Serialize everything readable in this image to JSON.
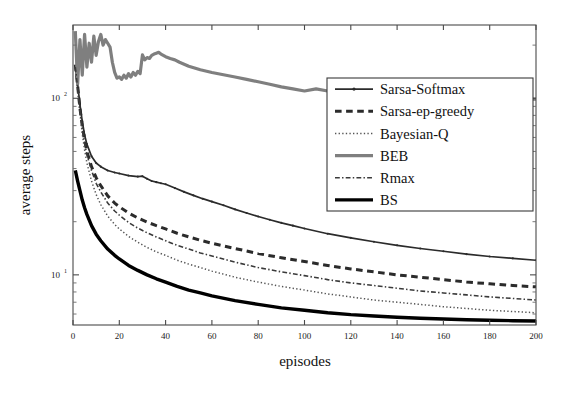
{
  "chart_data": {
    "type": "line",
    "title": "",
    "xlabel": "episodes",
    "ylabel": "average steps",
    "yscale": "log",
    "xscale": "linear",
    "xlim": [
      0,
      200
    ],
    "ylim": [
      5.2,
      260
    ],
    "xticks": [
      0,
      20,
      40,
      60,
      80,
      100,
      120,
      140,
      160,
      180,
      200
    ],
    "xticklabels": [
      "0",
      "20",
      "40",
      "60",
      "80",
      "100",
      "120",
      "140",
      "160",
      "180",
      "200"
    ],
    "yticks": [
      10,
      100
    ],
    "yticklabels": [
      "10",
      "10"
    ],
    "ytick_exponents": [
      "1",
      "2"
    ],
    "grid": false,
    "legend_position": "upper-right-inset",
    "series": [
      {
        "name": "Sarsa-Softmax",
        "color": "#2b2b2b",
        "style": "solid",
        "width": 1.7,
        "marker": "dot",
        "x": [
          1,
          2,
          3,
          4,
          5,
          6,
          8,
          10,
          12,
          15,
          18,
          20,
          24,
          28,
          30,
          32,
          34,
          36,
          38,
          40,
          44,
          48,
          52,
          56,
          60,
          65,
          70,
          75,
          80,
          85,
          90,
          95,
          100,
          110,
          120,
          130,
          140,
          150,
          160,
          170,
          180,
          190,
          200
        ],
        "y": [
          150,
          120,
          92,
          74,
          62,
          55,
          47,
          43,
          41,
          39,
          38,
          37.5,
          36.5,
          36,
          36.2,
          35,
          34,
          33.5,
          33,
          32.6,
          31,
          29.5,
          28.2,
          27,
          26,
          24.8,
          23.5,
          22.4,
          21.4,
          20.5,
          19.7,
          19,
          18.3,
          17.1,
          16.2,
          15.4,
          14.7,
          14.1,
          13.6,
          13.1,
          12.7,
          12.4,
          12.1
        ]
      },
      {
        "name": "Sarsa-ep-greedy",
        "color": "#2b2b2b",
        "style": "dashed",
        "width": 3.0,
        "x": [
          1,
          2,
          3,
          4,
          5,
          6,
          8,
          10,
          12,
          15,
          18,
          20,
          24,
          28,
          32,
          36,
          40,
          45,
          50,
          55,
          60,
          70,
          80,
          90,
          100,
          110,
          120,
          130,
          140,
          150,
          160,
          170,
          180,
          190,
          200
        ],
        "y": [
          155,
          118,
          88,
          70,
          58,
          50,
          41,
          35.5,
          32,
          28,
          25.5,
          24.3,
          22.4,
          21,
          19.9,
          19,
          18.2,
          17.2,
          16.4,
          15.7,
          15.1,
          14.1,
          13.2,
          12.5,
          11.9,
          11.3,
          10.8,
          10.4,
          10.0,
          9.7,
          9.4,
          9.1,
          8.9,
          8.7,
          8.55
        ]
      },
      {
        "name": "Bayesian-Q",
        "color": "#555555",
        "style": "dotted",
        "width": 1.5,
        "x": [
          1,
          2,
          3,
          4,
          5,
          6,
          8,
          10,
          12,
          15,
          18,
          20,
          24,
          28,
          32,
          36,
          40,
          45,
          50,
          55,
          60,
          70,
          80,
          90,
          100,
          110,
          120,
          130,
          140,
          150,
          160,
          170,
          180,
          190,
          200
        ],
        "y": [
          150,
          112,
          82,
          63,
          51,
          43,
          34,
          28.5,
          25,
          21.5,
          19.3,
          18.2,
          16.5,
          15.3,
          14.3,
          13.5,
          12.9,
          12.1,
          11.5,
          11.0,
          10.5,
          9.7,
          9.1,
          8.6,
          8.2,
          7.8,
          7.5,
          7.2,
          7.0,
          6.8,
          6.6,
          6.45,
          6.3,
          6.2,
          6.1
        ]
      },
      {
        "name": "BEB",
        "color": "#7f7f7f",
        "style": "solid",
        "width": 3.2,
        "x": [
          1,
          2,
          3,
          4,
          5,
          6,
          7,
          8,
          9,
          10,
          11,
          12,
          13,
          14,
          15,
          16,
          17,
          18,
          19,
          20,
          21,
          22,
          23,
          24,
          25,
          26,
          27,
          28,
          29,
          30,
          31,
          32,
          33,
          34,
          35,
          36,
          37,
          38,
          39,
          40,
          42,
          44,
          46,
          48,
          50,
          55,
          60,
          65,
          70,
          75,
          80,
          85,
          90,
          95,
          100,
          105,
          110,
          115,
          120,
          125,
          130,
          135,
          140,
          145,
          150,
          155,
          160,
          165,
          170,
          175,
          180,
          185,
          190,
          195,
          200
        ],
        "y": [
          240,
          120,
          215,
          135,
          230,
          150,
          205,
          160,
          225,
          175,
          210,
          230,
          200,
          215,
          205,
          195,
          160,
          140,
          130,
          132,
          128,
          135,
          130,
          138,
          132,
          140,
          135,
          142,
          138,
          176,
          165,
          170,
          168,
          175,
          178,
          180,
          182,
          178,
          175,
          172,
          168,
          165,
          160,
          156,
          152,
          145,
          140,
          136,
          132,
          128,
          124,
          120,
          116,
          113,
          110,
          113,
          110,
          108,
          106,
          104,
          102,
          101,
          100,
          99,
          98,
          98,
          99,
          99,
          100,
          100,
          101,
          101,
          100,
          99,
          99
        ]
      },
      {
        "name": "Rmax",
        "color": "#3a3a3a",
        "style": "dashdot",
        "width": 1.6,
        "x": [
          1,
          2,
          3,
          4,
          5,
          6,
          8,
          10,
          12,
          15,
          18,
          20,
          24,
          28,
          32,
          36,
          40,
          45,
          50,
          55,
          60,
          70,
          80,
          90,
          100,
          110,
          120,
          130,
          140,
          150,
          160,
          170,
          180,
          190,
          200
        ],
        "y": [
          150,
          115,
          86,
          68,
          56,
          48,
          39,
          33,
          29.5,
          25.5,
          23,
          21.8,
          19.8,
          18.4,
          17.3,
          16.4,
          15.6,
          14.7,
          14.0,
          13.3,
          12.8,
          11.8,
          11.0,
          10.4,
          9.9,
          9.4,
          9.0,
          8.7,
          8.4,
          8.1,
          7.9,
          7.7,
          7.5,
          7.35,
          7.2
        ]
      },
      {
        "name": "BS",
        "color": "#000000",
        "style": "solid",
        "width": 3.4,
        "x": [
          1,
          2,
          3,
          4,
          5,
          6,
          8,
          10,
          12,
          15,
          18,
          20,
          24,
          28,
          32,
          36,
          40,
          45,
          50,
          55,
          60,
          70,
          80,
          90,
          100,
          110,
          120,
          130,
          140,
          150,
          160,
          170,
          180,
          190,
          200
        ],
        "y": [
          39,
          34,
          30,
          26.5,
          24,
          22,
          19,
          17,
          15.6,
          14,
          12.9,
          12.3,
          11.3,
          10.6,
          10.0,
          9.5,
          9.1,
          8.6,
          8.2,
          7.9,
          7.6,
          7.15,
          6.8,
          6.5,
          6.3,
          6.1,
          5.95,
          5.85,
          5.75,
          5.68,
          5.62,
          5.57,
          5.53,
          5.5,
          5.48
        ]
      }
    ],
    "legend_entries": [
      {
        "label": "Sarsa-Softmax",
        "color": "#2b2b2b",
        "style": "solid",
        "width": 1.7,
        "marker": "dot"
      },
      {
        "label": "Sarsa-ep-greedy",
        "color": "#2b2b2b",
        "style": "dashed",
        "width": 3.0,
        "marker": "none"
      },
      {
        "label": "Bayesian-Q",
        "color": "#555555",
        "style": "dotted",
        "width": 1.5,
        "marker": "none"
      },
      {
        "label": "BEB",
        "color": "#7f7f7f",
        "style": "solid",
        "width": 3.2,
        "marker": "none"
      },
      {
        "label": "Rmax",
        "color": "#3a3a3a",
        "style": "dashdot",
        "width": 1.6,
        "marker": "none"
      },
      {
        "label": "BS",
        "color": "#000000",
        "style": "solid",
        "width": 3.4,
        "marker": "none"
      }
    ]
  },
  "axes": {
    "y_exp_label_top": "10",
    "y_exp_top": "2",
    "y_exp_label_bottom": "10",
    "y_exp_bottom": "1"
  }
}
